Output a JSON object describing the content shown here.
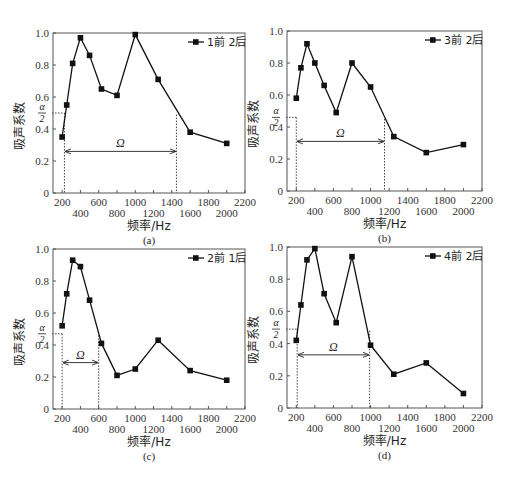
{
  "figure": {
    "panels_layout": "2x2"
  },
  "chart_data": [
    {
      "type": "line",
      "panel": "(a)",
      "title": "",
      "caption": "(a)",
      "legend": "1前 2后",
      "xlabel": "频率/Hz",
      "ylabel": "吸声系数",
      "xlim": [
        100,
        2200
      ],
      "ylim": [
        0,
        1.0
      ],
      "x_ticks_upper": [
        "200",
        "600",
        "1000",
        "1400",
        "1800",
        "2200"
      ],
      "x_ticks_lower": [
        "400",
        "800",
        "1200",
        "1600",
        "2000"
      ],
      "y_ticks": [
        "0",
        "0.2",
        "0.4",
        "0.6",
        "0.8",
        "1.0"
      ],
      "x": [
        200,
        250,
        315,
        400,
        500,
        630,
        800,
        1000,
        1250,
        1600,
        2000
      ],
      "values": [
        0.35,
        0.55,
        0.81,
        0.97,
        0.86,
        0.65,
        0.61,
        0.99,
        0.71,
        0.38,
        0.31
      ],
      "annotations": {
        "half_alpha_label": "α/2",
        "half_alpha_value": 0.5,
        "omega_label": "Ω",
        "omega_range": [
          225,
          1450
        ],
        "omega_arrow_y": 0.26
      },
      "frame": {
        "x0": 53,
        "x1": 245,
        "y0": 193,
        "y1": 33
      }
    },
    {
      "type": "line",
      "panel": "(b)",
      "title": "",
      "caption": "(b)",
      "legend": "3前 2后",
      "xlabel": "频率/Hz",
      "ylabel": "吸声系数",
      "xlim": [
        100,
        2200
      ],
      "ylim": [
        0,
        1.0
      ],
      "x_ticks_upper": [
        "200",
        "600",
        "1000",
        "1400",
        "1800",
        "2200"
      ],
      "x_ticks_lower": [
        "400",
        "800",
        "1200",
        "1600",
        "2000"
      ],
      "y_ticks": [
        "0",
        "0.2",
        "0.4",
        "0.6",
        "0.8",
        "1.0"
      ],
      "x": [
        200,
        250,
        315,
        400,
        500,
        630,
        800,
        1000,
        1250,
        1600,
        2000
      ],
      "values": [
        0.58,
        0.77,
        0.92,
        0.8,
        0.66,
        0.49,
        0.8,
        0.65,
        0.34,
        0.24,
        0.29
      ],
      "annotations": {
        "half_alpha_label": "α/2",
        "half_alpha_value": 0.46,
        "omega_label": "Ω",
        "omega_range": [
          200,
          1150
        ],
        "omega_arrow_y": 0.31
      },
      "frame": {
        "x0": 287,
        "x1": 482,
        "y0": 191,
        "y1": 31
      }
    },
    {
      "type": "line",
      "panel": "(c)",
      "title": "",
      "caption": "(c)",
      "legend": "2前 1后",
      "xlabel": "频率/Hz",
      "ylabel": "吸声系数",
      "xlim": [
        100,
        2200
      ],
      "ylim": [
        0,
        1.0
      ],
      "x_ticks_upper": [
        "200",
        "600",
        "1000",
        "1400",
        "1800",
        "2200"
      ],
      "x_ticks_lower": [
        "400",
        "800",
        "1200",
        "1600",
        "2000"
      ],
      "y_ticks": [
        "0",
        "0.2",
        "0.4",
        "0.6",
        "0.8",
        "1.0"
      ],
      "x": [
        200,
        250,
        315,
        400,
        500,
        630,
        800,
        1000,
        1250,
        1600,
        2000
      ],
      "values": [
        0.52,
        0.72,
        0.93,
        0.89,
        0.68,
        0.41,
        0.21,
        0.25,
        0.43,
        0.24,
        0.18
      ],
      "annotations": {
        "half_alpha_label": "α/2",
        "half_alpha_value": 0.47,
        "omega_label": "Ω",
        "omega_range": [
          200,
          600
        ],
        "omega_arrow_y": 0.29
      },
      "frame": {
        "x0": 53,
        "x1": 245,
        "y0": 409,
        "y1": 249
      }
    },
    {
      "type": "line",
      "panel": "(d)",
      "title": "",
      "caption": "(d)",
      "legend": "4前 2后",
      "xlabel": "频率/Hz",
      "ylabel": "吸声系数",
      "xlim": [
        100,
        2200
      ],
      "ylim": [
        0,
        1.0
      ],
      "x_ticks_upper": [
        "200",
        "600",
        "1000",
        "1400",
        "1800",
        "2200"
      ],
      "x_ticks_lower": [
        "400",
        "800",
        "1200",
        "1600",
        "2000"
      ],
      "y_ticks": [
        "0",
        "0.2",
        "0.4",
        "0.6",
        "0.8",
        "1.0"
      ],
      "x": [
        200,
        250,
        315,
        400,
        500,
        630,
        800,
        1000,
        1250,
        1600,
        2000
      ],
      "values": [
        0.42,
        0.64,
        0.92,
        0.99,
        0.71,
        0.53,
        0.94,
        0.39,
        0.21,
        0.28,
        0.09
      ],
      "annotations": {
        "half_alpha_label": "α/2",
        "half_alpha_value": 0.49,
        "omega_label": "Ω",
        "omega_range": [
          210,
          990
        ],
        "omega_arrow_y": 0.33
      },
      "frame": {
        "x0": 287,
        "x1": 482,
        "y0": 408,
        "y1": 247
      }
    }
  ]
}
